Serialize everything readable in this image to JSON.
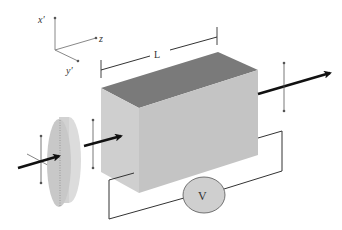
{
  "diagram": {
    "type": "electro-optic modulator setup",
    "axes": {
      "x_label": "x′",
      "y_label": "y′",
      "z_label": "z"
    },
    "crystal": {
      "length_label": "L",
      "top_color": "#7a7a7a",
      "front_color": "#c4c4c4",
      "end_color": "#cfcfcf"
    },
    "voltmeter": {
      "label": "V",
      "fill_color": "#cfcfcf"
    },
    "polarizer": {
      "fill_color": "#d2d2d2"
    },
    "beam_color": "#111111",
    "wire_color": "#333333"
  }
}
